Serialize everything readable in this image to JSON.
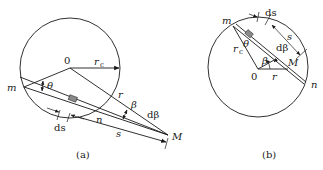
{
  "figure": {
    "panels": [
      {
        "id": "a",
        "caption": "(a)",
        "labels": {
          "center": "0",
          "radius": "r",
          "radius_sub": "c",
          "point_m": "m",
          "point_n": "n",
          "point_M": "M",
          "theta": "θ",
          "r": "r",
          "beta": "β",
          "dbeta": "dβ",
          "ds": "ds",
          "s": "s"
        }
      },
      {
        "id": "b",
        "caption": "(b)",
        "labels": {
          "center": "0",
          "radius": "r",
          "radius_sub": "c",
          "point_m": "m",
          "point_n": "n",
          "point_M": "M",
          "theta": "θ",
          "r": "r",
          "beta": "β",
          "dbeta": "dβ",
          "ds": "ds",
          "s": "s"
        }
      }
    ],
    "colors": {
      "line": "#1a1a1a",
      "element_fill": "#8a8a8a"
    }
  }
}
